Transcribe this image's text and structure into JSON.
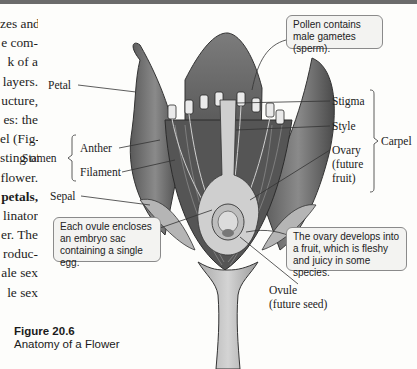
{
  "page": {
    "body_text_lines": [
      {
        "text": "zes and",
        "bold": false
      },
      {
        "text": "e com-",
        "bold": false
      },
      {
        "text": "k of a",
        "bold": false
      },
      {
        "text": "layers.",
        "bold": false
      },
      {
        "text": "ucture,",
        "bold": false
      },
      {
        "text": "es: the",
        "bold": false
      },
      {
        "text": "el (Fig-",
        "bold": false
      },
      {
        "text": "sting of",
        "bold": false
      },
      {
        "text": "flower.",
        "bold": false
      },
      {
        "text": "petals,",
        "bold": true
      },
      {
        "text": "linator",
        "bold": false
      },
      {
        "text": "er. The",
        "bold": false
      },
      {
        "text": "roduc-",
        "bold": false
      },
      {
        "text": "ale sex",
        "bold": false
      },
      {
        "text": "le sex",
        "bold": false
      }
    ]
  },
  "figure": {
    "number": "Figure 20.6",
    "title": "Anatomy of a Flower",
    "labels": {
      "petal": "Petal",
      "stamen": "Stamen",
      "anther": "Anther",
      "filament": "Filament",
      "sepal": "Sepal",
      "stigma": "Stigma",
      "style": "Style",
      "carpel": "Carpel",
      "ovary_1": "Ovary",
      "ovary_2": "(future",
      "ovary_3": "fruit)",
      "ovule_1": "Ovule",
      "ovule_2": "(future seed)"
    },
    "callouts": {
      "pollen": "Pollen contains male gametes (sperm).",
      "ovule": "Each ovule encloses an embryo sac containing a single egg.",
      "ovary": "The ovary develops into a fruit, which is fleshy and juicy in some species."
    }
  }
}
